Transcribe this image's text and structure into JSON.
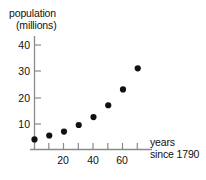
{
  "chart_data": {
    "type": "scatter",
    "title": "",
    "ylabel_line1": "population",
    "ylabel_line2": "(millions)",
    "xlabel_line1": "years",
    "xlabel_line2": "since 1790",
    "xlabel": "years since 1790",
    "ylabel": "population (millions)",
    "x": [
      0,
      10,
      20,
      30,
      40,
      50,
      60,
      70
    ],
    "values": [
      4,
      5.5,
      7,
      9.5,
      12.5,
      17,
      23,
      31
    ],
    "points": [
      {
        "x": 0,
        "y": 4
      },
      {
        "x": 10,
        "y": 5.5
      },
      {
        "x": 20,
        "y": 7
      },
      {
        "x": 30,
        "y": 9.5
      },
      {
        "x": 40,
        "y": 12.5
      },
      {
        "x": 50,
        "y": 17
      },
      {
        "x": 60,
        "y": 23
      },
      {
        "x": 70,
        "y": 31
      }
    ],
    "xlim": [
      0,
      80
    ],
    "ylim": [
      0,
      45
    ],
    "xticks_major": [
      20,
      40,
      60
    ],
    "xticks_minor": [
      10,
      30,
      50,
      70
    ],
    "yticks_major": [
      10,
      20,
      30,
      40
    ],
    "xtick_labels": [
      "20",
      "40",
      "60"
    ],
    "ytick_labels": [
      "10",
      "20",
      "30",
      "40"
    ],
    "grid": false,
    "legend": false,
    "marker": "filled-circle",
    "marker_color": "#111111",
    "axis_color": "#8a8a8a",
    "background": "#ffffff"
  }
}
